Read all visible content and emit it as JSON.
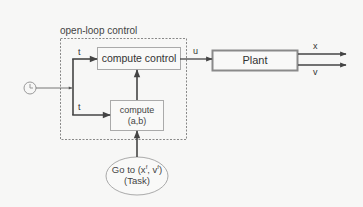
{
  "diagram": {
    "title": "open-loop control",
    "blocks": {
      "compute_control": {
        "label": "compute control"
      },
      "compute_ab": {
        "label_line1": "compute",
        "label_line2": "(a,b)"
      },
      "plant": {
        "label": "Plant"
      },
      "task": {
        "prefix": "Go to (x",
        "sup1": "f",
        "mid": ", v",
        "sup2": "f",
        "suffix": ")",
        "label_line2": "(Task)"
      }
    },
    "signals": {
      "t_top": "t",
      "t_bottom": "t",
      "u": "u",
      "x": "x",
      "v": "v"
    },
    "icons": {
      "clock": "clock-icon"
    },
    "colors": {
      "background": "#f7f7f6",
      "line": "#444444",
      "box_border": "#999999",
      "plant_border": "#8a8a8a",
      "dashed": "#888888"
    }
  }
}
